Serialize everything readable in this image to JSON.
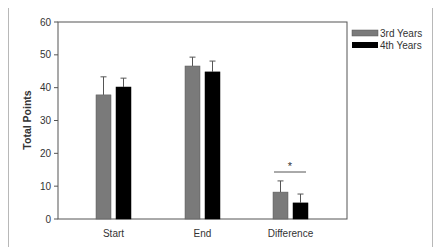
{
  "chart_data": {
    "type": "bar",
    "title": "",
    "xlabel": "",
    "ylabel": "Total Points",
    "ylim": [
      0,
      60
    ],
    "yticks": [
      0,
      10,
      20,
      30,
      40,
      50,
      60
    ],
    "categories": [
      "Start",
      "End",
      "Difference"
    ],
    "series": [
      {
        "name": "3rd Years",
        "color": "#7a7a7a",
        "values": [
          37.8,
          46.6,
          8.2
        ],
        "error": [
          5.5,
          2.7,
          3.4
        ]
      },
      {
        "name": "4th Years",
        "color": "#000000",
        "values": [
          40.2,
          44.8,
          4.9
        ],
        "error": [
          2.7,
          3.3,
          2.7
        ]
      }
    ],
    "annotations": [
      {
        "text": "*",
        "category": "Difference",
        "type": "significance"
      }
    ],
    "legend_position": "right-top",
    "grid": false
  },
  "labels": {
    "ylabel": "Total Points",
    "yticks": [
      "0",
      "10",
      "20",
      "30",
      "40",
      "50",
      "60"
    ],
    "categories": [
      "Start",
      "End",
      "Difference"
    ],
    "legend": [
      "3rd Years",
      "4th Years"
    ],
    "significance": "*"
  }
}
